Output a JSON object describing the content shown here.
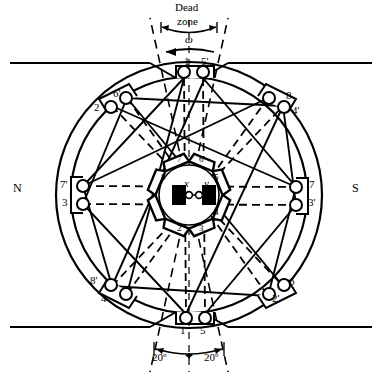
{
  "figure": {
    "type": "motor-cross-section-diagram",
    "title_text": "Dead zone",
    "rotation_symbol": "ω",
    "pole_left": "N",
    "pole_right": "S",
    "rotor_axis_x": "x",
    "rotor_axis_y": "y",
    "angle_left": "20º",
    "angle_right": "20º",
    "dead_zone_line1": "Dead",
    "dead_zone_line2": "zone"
  },
  "outer_terminals": [
    {
      "id": "t-top-left",
      "label": "1",
      "x": 184,
      "y": 63
    },
    {
      "id": "t-top-right",
      "label": "5'",
      "x": 206,
      "y": 63
    },
    {
      "id": "t-ul-outer",
      "label": "2",
      "x": 95,
      "y": 103
    },
    {
      "id": "t-ul-inner",
      "label": "6'",
      "x": 113,
      "y": 92
    },
    {
      "id": "t-ur-inner",
      "label": "8",
      "x": 284,
      "y": 92
    },
    {
      "id": "t-ur-outer",
      "label": "4'",
      "x": 300,
      "y": 103
    },
    {
      "id": "t-left-upper",
      "label": "7'",
      "x": 68,
      "y": 184
    },
    {
      "id": "t-left-lower",
      "label": "3",
      "x": 68,
      "y": 203
    },
    {
      "id": "t-right-upper",
      "label": "7",
      "x": 325,
      "y": 184
    },
    {
      "id": "t-right-lower",
      "label": "3'",
      "x": 325,
      "y": 203
    },
    {
      "id": "t-ll-inner",
      "label": "8'",
      "x": 95,
      "y": 281
    },
    {
      "id": "t-ll-outer",
      "label": "4",
      "x": 104,
      "y": 297
    },
    {
      "id": "t-lr-outer",
      "label": "2'",
      "x": 275,
      "y": 297
    },
    {
      "id": "t-lr-inner",
      "label": "6",
      "x": 291,
      "y": 283
    },
    {
      "id": "t-bot-left",
      "label": "1'",
      "x": 182,
      "y": 326
    },
    {
      "id": "t-bot-right",
      "label": "5",
      "x": 203,
      "y": 326
    }
  ],
  "inner_segments": [
    {
      "id": "seg-7",
      "label": "7"
    },
    {
      "id": "seg-6",
      "label": "6"
    },
    {
      "id": "seg-5",
      "label": "5"
    },
    {
      "id": "seg-4",
      "label": "4"
    },
    {
      "id": "seg-3",
      "label": "3"
    },
    {
      "id": "seg-2",
      "label": "2"
    },
    {
      "id": "seg-1",
      "label": "1"
    },
    {
      "id": "seg-8",
      "label": "8"
    }
  ],
  "colors": {
    "stroke": "#000000",
    "fill": "#ffffff",
    "rotor_pole": "#000000"
  }
}
